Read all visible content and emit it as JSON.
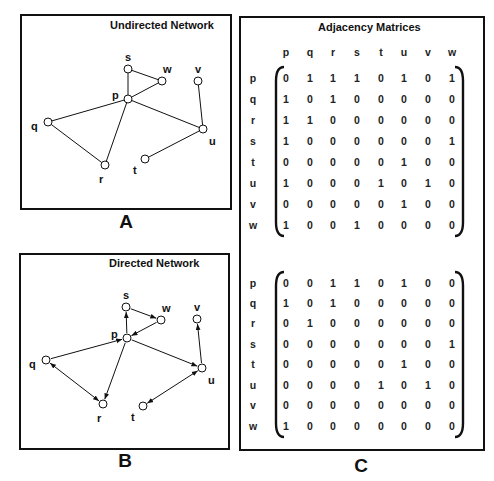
{
  "panels": {
    "A": {
      "title": "Undirected Network",
      "label": "A"
    },
    "B": {
      "title": "Directed Network",
      "label": "B"
    },
    "C": {
      "title": "Adjacency Matrices",
      "label": "C"
    }
  },
  "nodes": [
    "p",
    "q",
    "r",
    "s",
    "t",
    "u",
    "v",
    "w"
  ],
  "undirected_edges": [
    [
      "p",
      "q"
    ],
    [
      "p",
      "r"
    ],
    [
      "p",
      "s"
    ],
    [
      "p",
      "u"
    ],
    [
      "p",
      "w"
    ],
    [
      "q",
      "r"
    ],
    [
      "s",
      "w"
    ],
    [
      "u",
      "t"
    ],
    [
      "u",
      "v"
    ]
  ],
  "directed_edges": [
    {
      "from": "p",
      "to": "s"
    },
    {
      "from": "s",
      "to": "w"
    },
    {
      "from": "w",
      "to": "p"
    },
    {
      "from": "q",
      "to": "p"
    },
    {
      "from": "p",
      "to": "u"
    },
    {
      "from": "u",
      "to": "v"
    },
    {
      "from": "p",
      "to": "r"
    },
    {
      "from": "q",
      "to": "r"
    },
    {
      "from": "r",
      "to": "q"
    },
    {
      "from": "t",
      "to": "u"
    },
    {
      "from": "u",
      "to": "t"
    }
  ],
  "matrix_undirected": [
    [
      0,
      1,
      1,
      1,
      0,
      1,
      0,
      1
    ],
    [
      1,
      0,
      1,
      0,
      0,
      0,
      0,
      0
    ],
    [
      1,
      1,
      0,
      0,
      0,
      0,
      0,
      0
    ],
    [
      1,
      0,
      0,
      0,
      0,
      0,
      0,
      1
    ],
    [
      0,
      0,
      0,
      0,
      0,
      1,
      0,
      0
    ],
    [
      1,
      0,
      0,
      0,
      1,
      0,
      1,
      0
    ],
    [
      0,
      0,
      0,
      0,
      0,
      1,
      0,
      0
    ],
    [
      1,
      0,
      0,
      1,
      0,
      0,
      0,
      0
    ]
  ],
  "matrix_directed": [
    [
      0,
      0,
      1,
      1,
      0,
      1,
      0,
      0
    ],
    [
      1,
      0,
      1,
      0,
      0,
      0,
      0,
      0
    ],
    [
      0,
      1,
      0,
      0,
      0,
      0,
      0,
      0
    ],
    [
      0,
      0,
      0,
      0,
      0,
      0,
      0,
      1
    ],
    [
      0,
      0,
      0,
      0,
      0,
      1,
      0,
      0
    ],
    [
      0,
      0,
      0,
      0,
      1,
      0,
      1,
      0
    ],
    [
      0,
      0,
      0,
      0,
      0,
      0,
      0,
      0
    ],
    [
      1,
      0,
      0,
      0,
      0,
      0,
      0,
      0
    ]
  ]
}
